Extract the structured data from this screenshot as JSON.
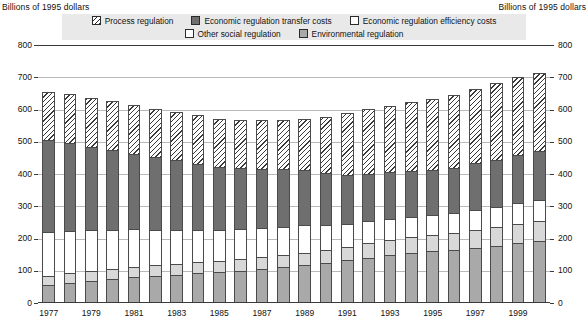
{
  "header": {
    "caption_left": "Billions of 1995 dollars",
    "caption_right": "Billions of 1995 dollars"
  },
  "legend": {
    "row1": [
      {
        "key": "process",
        "label": "Process regulation",
        "color": "#ffffff",
        "pattern": "diagonal-hatch"
      },
      {
        "key": "transfer",
        "label": "Economic regulation transfer costs",
        "color": "#6f6f6f",
        "pattern": "solid"
      },
      {
        "key": "efficiency",
        "label": "Economic regulation efficiency costs",
        "color": "#ffffff",
        "pattern": "solid"
      }
    ],
    "row2": [
      {
        "key": "othersocial",
        "label": "Other social regulation",
        "color": "#ffffff",
        "pattern": "solid"
      },
      {
        "key": "environmental",
        "label": "Environmental regulation",
        "color": "#a9a9a9",
        "pattern": "solid"
      }
    ]
  },
  "axis": {
    "y_ticks": [
      "800",
      "700",
      "600",
      "500",
      "400",
      "300",
      "200",
      "100",
      "0"
    ],
    "x_ticks": [
      "1977",
      "1979",
      "1981",
      "1983",
      "1985",
      "1987",
      "1989",
      "1991",
      "1993",
      "1995",
      "1997",
      "1999"
    ]
  },
  "chart_data": {
    "type": "bar",
    "stacked": true,
    "title": "",
    "subtitle": "",
    "xlabel": "",
    "ylabel": "Billions of 1995 dollars",
    "ylim": [
      0,
      800
    ],
    "ytick_step": 100,
    "grid": true,
    "legend_position": "top",
    "categories": [
      "1977",
      "1978",
      "1979",
      "1980",
      "1981",
      "1982",
      "1983",
      "1984",
      "1985",
      "1986",
      "1987",
      "1988",
      "1989",
      "1990",
      "1991",
      "1992",
      "1993",
      "1994",
      "1995",
      "1996",
      "1997",
      "1998",
      "1999",
      "2000"
    ],
    "series": [
      {
        "name": "Environmental regulation",
        "color": "#a9a9a9",
        "values": [
          55,
          62,
          68,
          74,
          80,
          84,
          88,
          92,
          96,
          100,
          106,
          112,
          118,
          125,
          132,
          140,
          148,
          155,
          160,
          165,
          172,
          178,
          185,
          192
        ]
      },
      {
        "name": "Other social regulation",
        "color": "#d8d8d8",
        "values": [
          30,
          30,
          32,
          32,
          33,
          33,
          34,
          35,
          35,
          36,
          36,
          37,
          38,
          40,
          42,
          45,
          48,
          50,
          52,
          53,
          55,
          57,
          59,
          61
        ]
      },
      {
        "name": "Economic regulation efficiency costs",
        "color": "#ffffff",
        "values": [
          135,
          130,
          125,
          120,
          115,
          110,
          105,
          100,
          95,
          92,
          90,
          88,
          86,
          78,
          72,
          68,
          64,
          62,
          60,
          60,
          62,
          64,
          66,
          68
        ]
      },
      {
        "name": "Economic regulation transfer costs",
        "color": "#6f6f6f",
        "values": [
          285,
          275,
          260,
          248,
          235,
          225,
          215,
          205,
          196,
          190,
          184,
          178,
          172,
          160,
          152,
          148,
          145,
          143,
          142,
          142,
          144,
          146,
          148,
          150
        ]
      },
      {
        "name": "Process regulation",
        "color": "#ffffff",
        "values": [
          148,
          150,
          152,
          152,
          152,
          150,
          150,
          150,
          150,
          150,
          152,
          154,
          156,
          175,
          190,
          200,
          207,
          212,
          218,
          224,
          230,
          236,
          242,
          242
        ]
      }
    ],
    "totals": [
      653,
      647,
      637,
      626,
      615,
      602,
      592,
      582,
      572,
      568,
      568,
      569,
      570,
      578,
      588,
      601,
      612,
      622,
      632,
      644,
      663,
      681,
      700,
      713
    ]
  }
}
